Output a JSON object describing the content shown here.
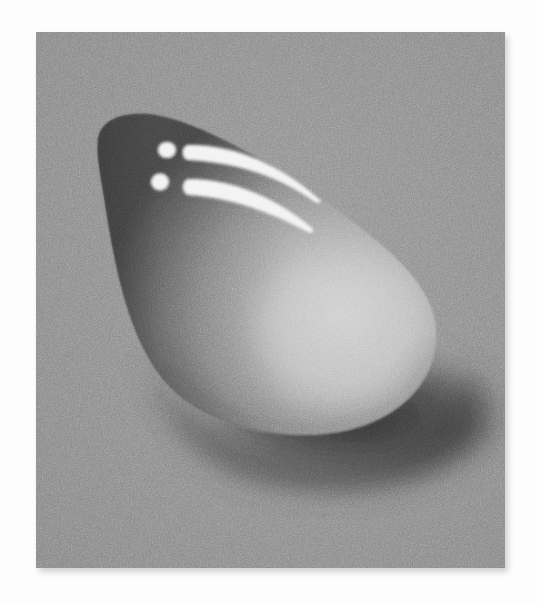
{
  "image": {
    "subject": "Painted glossy pebble / water drop with cast shadow on textured gray ground",
    "alt": "A smooth rounded teardrop-shaped stone resting on a gray speckled surface, with two white dots and two curved white highlight streaks on its upper-left, and a dark shadow beneath its lower right edge.",
    "colors": {
      "page_background": "#fdfdfd",
      "ground": "#8b8b8b",
      "blob_dark": "#4a4a4a",
      "blob_mid": "#7e7e7e",
      "blob_light": "#c4c4c4",
      "shadow": "#2e2e2e",
      "highlight": "#f2f2f2"
    },
    "elements": {
      "panel": "textured gray canvas",
      "blob": "smooth rounded pebble",
      "highlights": [
        "dot-upper",
        "dot-lower",
        "streak-upper",
        "streak-lower"
      ],
      "cast_shadow": "dark shadow under lower-right edge"
    }
  }
}
